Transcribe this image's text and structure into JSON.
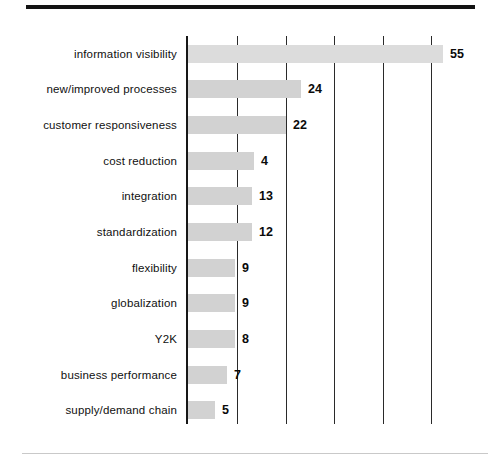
{
  "chart_data": {
    "type": "bar",
    "orientation": "horizontal",
    "title": "",
    "subtitle": "",
    "xlabel": "",
    "ylabel": "",
    "grid": true,
    "gridlines_x": [
      0,
      10,
      20,
      30,
      40,
      50
    ],
    "xlim": [
      0,
      55
    ],
    "legend": "none",
    "categories": [
      "information visibility",
      "new/improved processes",
      "customer responsiveness",
      "cost reduction",
      "integration",
      "standardization",
      "flexibility",
      "globalization",
      "Y2K",
      "business performance",
      "supply/demand chain"
    ],
    "values": [
      55,
      24,
      22,
      4,
      13,
      12,
      9,
      9,
      8,
      7,
      5
    ],
    "value_labels": [
      "55",
      "24",
      "22",
      "4",
      "13",
      "12",
      "9",
      "9",
      "8",
      "7",
      "5"
    ],
    "bar_pixel_widths": [
      255,
      113,
      98,
      66,
      64,
      64,
      47,
      47,
      47,
      39,
      27
    ],
    "bar_color": "#d2d2d2",
    "axis_color": "#171717",
    "grid_color": "#2a2a2a",
    "text_color": "#101010",
    "background": "#ffffff"
  },
  "figure": {
    "top_rule_color": "#131313",
    "bottom_rule_color": "#c9c9c9"
  }
}
